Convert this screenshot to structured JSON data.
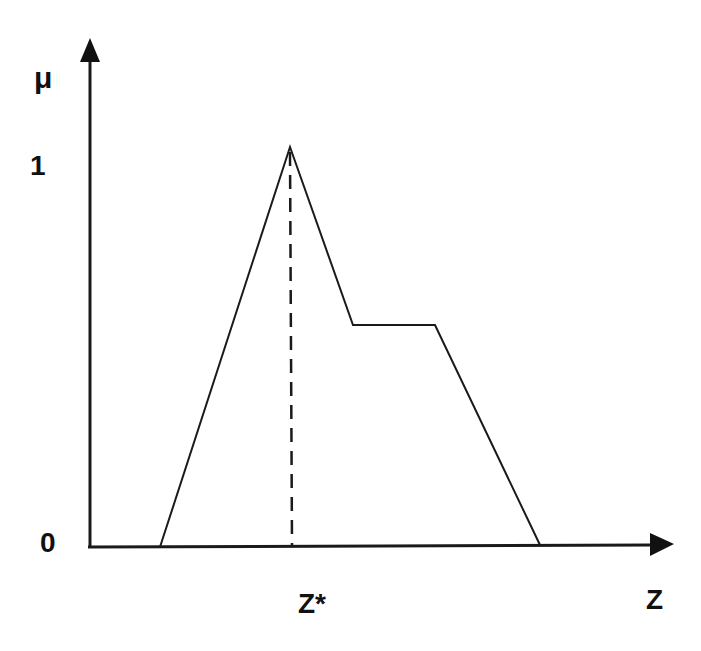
{
  "diagram": {
    "type": "fuzzy-membership-function",
    "y_axis_label": "μ",
    "x_axis_label": "Z",
    "y_ticks": [
      "1",
      "0"
    ],
    "x_marker_label": "Z*",
    "shape": "triangle peak followed by lower plateau, then descending to zero",
    "membership_points": [
      {
        "z": "a",
        "mu": 0
      },
      {
        "z": "Z*",
        "mu": 1
      },
      {
        "z": "b",
        "mu": 0.56
      },
      {
        "z": "c",
        "mu": 0.56
      },
      {
        "z": "d",
        "mu": 0
      }
    ],
    "colors": {
      "line": "#1a1a1a",
      "background": "#ffffff"
    }
  }
}
